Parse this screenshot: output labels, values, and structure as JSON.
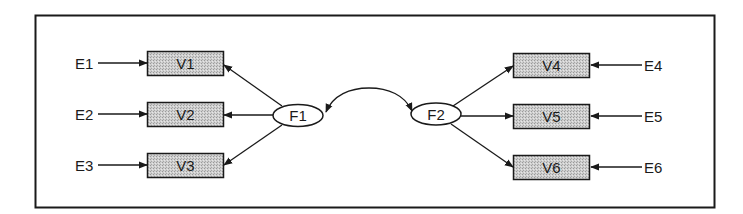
{
  "diagram": {
    "type": "structural-equation-model",
    "colors": {
      "line": "#1a1a1a",
      "box_fill": "#c8c8c8",
      "background": "#ffffff"
    },
    "errors_left": [
      {
        "id": "E1",
        "label": "E1",
        "target": "V1"
      },
      {
        "id": "E2",
        "label": "E2",
        "target": "V2"
      },
      {
        "id": "E3",
        "label": "E3",
        "target": "V3"
      }
    ],
    "observed_left": [
      {
        "id": "V1",
        "label": "V1"
      },
      {
        "id": "V2",
        "label": "V2"
      },
      {
        "id": "V3",
        "label": "V3"
      }
    ],
    "observed_right": [
      {
        "id": "V4",
        "label": "V4"
      },
      {
        "id": "V5",
        "label": "V5"
      },
      {
        "id": "V6",
        "label": "V6"
      }
    ],
    "errors_right": [
      {
        "id": "E4",
        "label": "E4",
        "target": "V4"
      },
      {
        "id": "E5",
        "label": "E5",
        "target": "V5"
      },
      {
        "id": "E6",
        "label": "E6",
        "target": "V6"
      }
    ],
    "factors": [
      {
        "id": "F1",
        "label": "F1",
        "indicators": [
          "V1",
          "V2",
          "V3"
        ]
      },
      {
        "id": "F2",
        "label": "F2",
        "indicators": [
          "V4",
          "V5",
          "V6"
        ]
      }
    ],
    "covariance": {
      "from": "F1",
      "to": "F2",
      "bidirectional": true
    }
  }
}
